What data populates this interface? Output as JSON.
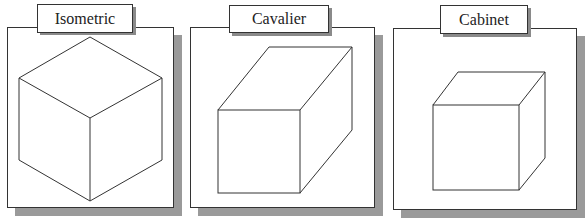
{
  "panels": [
    {
      "title": "Isometric"
    },
    {
      "title": "Cavalier"
    },
    {
      "title": "Cabinet"
    }
  ],
  "colors": {
    "line": "#333333",
    "shadow": "#9a9a9a",
    "background": "#ffffff"
  }
}
